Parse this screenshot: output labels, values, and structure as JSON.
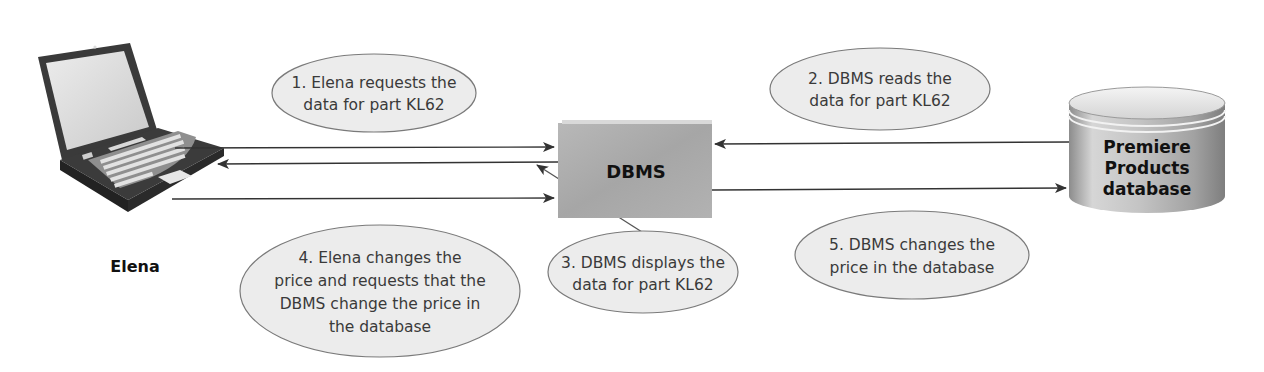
{
  "diagram": {
    "actor": {
      "name": "Elena",
      "icon": "laptop-icon"
    },
    "dbms": {
      "label": "DBMS"
    },
    "database": {
      "line1": "Premiere",
      "line2": "Products",
      "line3": "database",
      "icon": "database-cylinder-icon"
    },
    "steps": [
      {
        "number": 1,
        "lines": [
          "1. Elena requests the",
          "data for part KL62"
        ]
      },
      {
        "number": 2,
        "lines": [
          "2. DBMS reads the",
          "data for part KL62"
        ]
      },
      {
        "number": 3,
        "lines": [
          "3. DBMS displays the",
          "data for part KL62"
        ]
      },
      {
        "number": 4,
        "lines": [
          "4. Elena changes the",
          "price and requests that the",
          "DBMS change the price in",
          "the database"
        ]
      },
      {
        "number": 5,
        "lines": [
          "5. DBMS changes the",
          "price in the database"
        ]
      }
    ],
    "colors": {
      "bubble_fill": "#ececec",
      "bubble_stroke": "#7a7a7a",
      "dbms_fill": "#a9a9a9",
      "arrow": "#333333",
      "text": "#3a3a3a"
    }
  }
}
